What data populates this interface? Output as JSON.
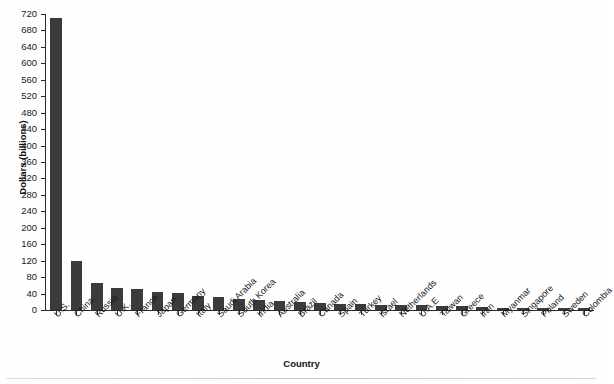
{
  "chart_data": {
    "type": "bar",
    "title": "",
    "xlabel": "Country",
    "ylabel": "Dollars (billions)",
    "ylim": [
      0,
      720
    ],
    "ytick_step": 40,
    "yticks": [
      0,
      40,
      80,
      120,
      160,
      200,
      240,
      280,
      320,
      360,
      400,
      440,
      480,
      520,
      560,
      600,
      640,
      680,
      720
    ],
    "grid": false,
    "legend": null,
    "bar_color": "#3b3b3b",
    "axis_color": "#2a2a2a",
    "categories": [
      "U.S.",
      "China",
      "Russia",
      "U.K.",
      "France",
      "Japan",
      "Germany",
      "Italy",
      "Saudi Arabia",
      "South Korea",
      "India",
      "Australia",
      "Brazil",
      "Canada",
      "Spain",
      "Turkey",
      "Israel",
      "Netherlands",
      "U.A.E",
      "Taiwan",
      "Greece",
      "Iran",
      "Myanmar",
      "Singapore",
      "Poland",
      "Sweden",
      "Colombia"
    ],
    "values": [
      710,
      120,
      66,
      53,
      50,
      45,
      41,
      35,
      32,
      28,
      25,
      21,
      19,
      16,
      15,
      14,
      13,
      12,
      11,
      10,
      9,
      8,
      6,
      6,
      5,
      5,
      4
    ]
  }
}
